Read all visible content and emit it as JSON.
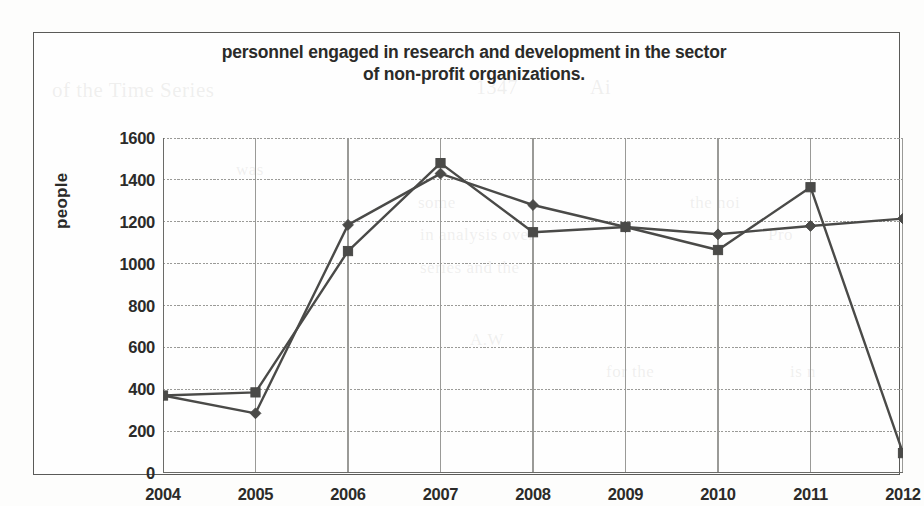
{
  "chart_data": {
    "type": "line",
    "title": "personnel engaged in research and development in the sector of non-profit organizations.",
    "title_line1": "personnel engaged in research and development in the sector",
    "title_line2": "of non-profit organizations.",
    "xlabel": "",
    "ylabel": "people",
    "categories": [
      "2004",
      "2005",
      "2006",
      "2007",
      "2008",
      "2009",
      "2010",
      "2011",
      "2012"
    ],
    "ylim": [
      0,
      1600
    ],
    "ytick_labels": [
      "0",
      "200",
      "400",
      "600",
      "800",
      "1000",
      "1200",
      "1400",
      "1600"
    ],
    "ytick_values": [
      0,
      200,
      400,
      600,
      800,
      1000,
      1200,
      1400,
      1600
    ],
    "ytick_step": 200,
    "grid": true,
    "legend": "none",
    "series": [
      {
        "name": "series-1",
        "marker": "diamond",
        "color": "#4a4a48",
        "values": [
          370,
          285,
          1185,
          1430,
          1280,
          1175,
          1140,
          1180,
          1215
        ]
      },
      {
        "name": "series-2",
        "marker": "square",
        "color": "#4a4a48",
        "values": [
          370,
          385,
          1060,
          1480,
          1150,
          1175,
          1065,
          1365,
          95
        ]
      }
    ]
  },
  "style": {
    "line_color": "#4a4a48",
    "grid_color": "#9a9a97",
    "axis_color": "#6b6b68",
    "frame_color": "#5a5a58",
    "text_color": "#2b2b29",
    "page_background": "#fdfdfc"
  },
  "ghost_text": {
    "items": [
      {
        "text": "of the Time Series",
        "x": 52,
        "y": 78,
        "size": 21
      },
      {
        "text": "1347",
        "x": 476,
        "y": 76,
        "size": 20
      },
      {
        "text": "Ai",
        "x": 590,
        "y": 76,
        "size": 20
      },
      {
        "text": "was",
        "x": 236,
        "y": 160,
        "size": 17
      },
      {
        "text": "some",
        "x": 418,
        "y": 193,
        "size": 17
      },
      {
        "text": "the noi",
        "x": 690,
        "y": 193,
        "size": 17
      },
      {
        "text": "in analysis over",
        "x": 420,
        "y": 225,
        "size": 17
      },
      {
        "text": "Pro",
        "x": 768,
        "y": 225,
        "size": 17
      },
      {
        "text": "series and the",
        "x": 420,
        "y": 258,
        "size": 17
      },
      {
        "text": "A.W",
        "x": 470,
        "y": 330,
        "size": 17
      },
      {
        "text": "for the",
        "x": 606,
        "y": 362,
        "size": 17
      },
      {
        "text": "is n",
        "x": 790,
        "y": 362,
        "size": 17
      }
    ]
  }
}
